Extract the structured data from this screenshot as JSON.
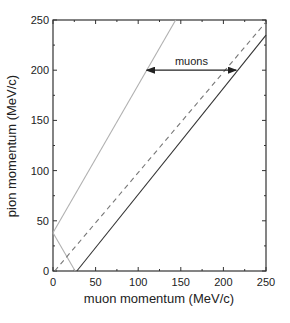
{
  "chart_data": {
    "type": "line",
    "title": "",
    "xlabel": "muon momentum (MeV/c)",
    "ylabel": "pion momentum (MeV/c)",
    "xlim": [
      0,
      250
    ],
    "ylim": [
      0,
      250
    ],
    "xticks": [
      0,
      50,
      100,
      150,
      200,
      250
    ],
    "yticks": [
      0,
      50,
      100,
      150,
      200,
      250
    ],
    "xtick_labels": [
      "0",
      "50",
      "100",
      "150",
      "200",
      "250"
    ],
    "ytick_labels": [
      "0",
      "50",
      "100",
      "150",
      "200",
      "250"
    ],
    "grid": false,
    "legend": null,
    "series": [
      {
        "name": "light-gray-rising",
        "style": "solid",
        "color": "#b0b0b0",
        "x": [
          0,
          144
        ],
        "y": [
          38,
          250
        ]
      },
      {
        "name": "light-gray-falling",
        "style": "solid",
        "color": "#b0b0b0",
        "x": [
          0,
          26
        ],
        "y": [
          38,
          0
        ]
      },
      {
        "name": "dashed",
        "style": "dashed",
        "color": "#777777",
        "x": [
          2,
          250
        ],
        "y": [
          0,
          248
        ]
      },
      {
        "name": "dark-solid",
        "style": "solid",
        "color": "#333333",
        "x": [
          28,
          250
        ],
        "y": [
          0,
          235
        ]
      }
    ],
    "annotations": [
      {
        "text": "muons",
        "type": "double-arrow",
        "y": 200,
        "x_from": 110,
        "x_to": 215
      }
    ]
  }
}
